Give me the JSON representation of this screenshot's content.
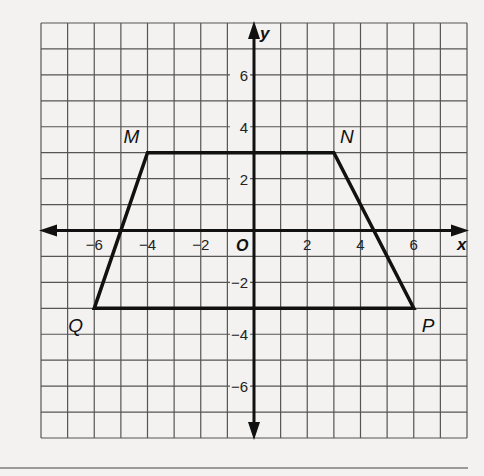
{
  "chart_data": {
    "type": "scatter",
    "title": "",
    "xlabel": "x",
    "ylabel": "y",
    "xlim": [
      -8,
      8
    ],
    "ylim": [
      -8,
      8
    ],
    "grid": true,
    "grid_step": 1,
    "origin_label": "O",
    "x_ticks": [
      -6,
      -4,
      -2,
      2,
      4,
      6
    ],
    "y_ticks": [
      6,
      4,
      2,
      -2,
      -4,
      -6
    ],
    "x_tick_labels": [
      "−6",
      "−4",
      "−2",
      "2",
      "4",
      "6"
    ],
    "y_tick_labels": [
      "6",
      "4",
      "2",
      "−2",
      "−4",
      "−6"
    ],
    "shape": "trapezoid",
    "vertices": [
      {
        "label": "M",
        "x": -4,
        "y": 3
      },
      {
        "label": "N",
        "x": 3,
        "y": 3
      },
      {
        "label": "P",
        "x": 6,
        "y": -3
      },
      {
        "label": "Q",
        "x": -6,
        "y": -3
      }
    ],
    "polygon_order": [
      "M",
      "N",
      "P",
      "Q"
    ]
  },
  "colors": {
    "background": "#f3f2f0",
    "grid": "#555555",
    "axes": "#111111",
    "shape": "#111111"
  }
}
